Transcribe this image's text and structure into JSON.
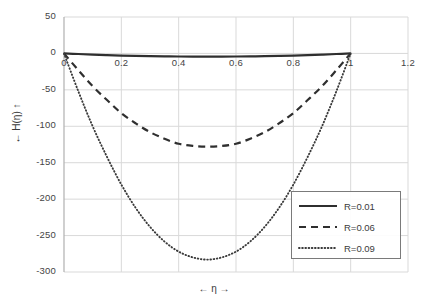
{
  "chart_data": {
    "type": "line",
    "title": "",
    "xlabel": "← η →",
    "ylabel": "← H(η) ↑",
    "xlim": [
      0,
      1.2
    ],
    "ylim": [
      -300,
      50
    ],
    "grid": true,
    "legend_position": "bottom-right",
    "x_ticks": [
      "0",
      "0.2",
      "0.4",
      "0.6",
      "0.8",
      "1",
      "1.2"
    ],
    "x_tick_values": [
      0,
      0.2,
      0.4,
      0.6,
      0.8,
      1,
      1.2
    ],
    "y_ticks": [
      "50",
      "0",
      "-50",
      "-100",
      "-150",
      "-200",
      "-250",
      "-300"
    ],
    "y_tick_values": [
      50,
      0,
      -50,
      -100,
      -150,
      -200,
      -250,
      -300
    ],
    "x": [
      0,
      0.05,
      0.1,
      0.15,
      0.2,
      0.25,
      0.3,
      0.35,
      0.4,
      0.45,
      0.5,
      0.55,
      0.6,
      0.65,
      0.7,
      0.75,
      0.8,
      0.85,
      0.9,
      0.95,
      1
    ],
    "series": [
      {
        "name": "R=0.01",
        "style": "solid",
        "color": "#2f2f2f",
        "values": [
          0,
          -0.8,
          -1.6,
          -2.3,
          -2.9,
          -3.4,
          -3.8,
          -4.0,
          -4.2,
          -4.3,
          -4.3,
          -4.3,
          -4.2,
          -4.0,
          -3.8,
          -3.4,
          -2.9,
          -2.3,
          -1.6,
          -0.8,
          0
        ]
      },
      {
        "name": "R=0.06",
        "style": "dashed",
        "color": "#2f2f2f",
        "values": [
          0,
          -23,
          -45,
          -64,
          -82,
          -96,
          -108,
          -117,
          -124,
          -127,
          -128,
          -127,
          -124,
          -117,
          -108,
          -96,
          -82,
          -64,
          -45,
          -23,
          0
        ]
      },
      {
        "name": "R=0.09",
        "style": "dotted",
        "color": "#3a3a3a",
        "values": [
          0,
          -52,
          -100,
          -142,
          -180,
          -212,
          -238,
          -258,
          -272,
          -280,
          -283,
          -280,
          -272,
          -258,
          -238,
          -212,
          -180,
          -142,
          -100,
          -52,
          0
        ]
      }
    ],
    "minima": {
      "R=0.01": -4.3,
      "R=0.06": -128,
      "R=0.09": -283
    }
  },
  "legend": {
    "items": [
      {
        "label": "R=0.01"
      },
      {
        "label": "R=0.06"
      },
      {
        "label": "R=0.09"
      }
    ]
  },
  "axes": {
    "x_title": "← η →",
    "y_title": "← H(η) ↑"
  }
}
